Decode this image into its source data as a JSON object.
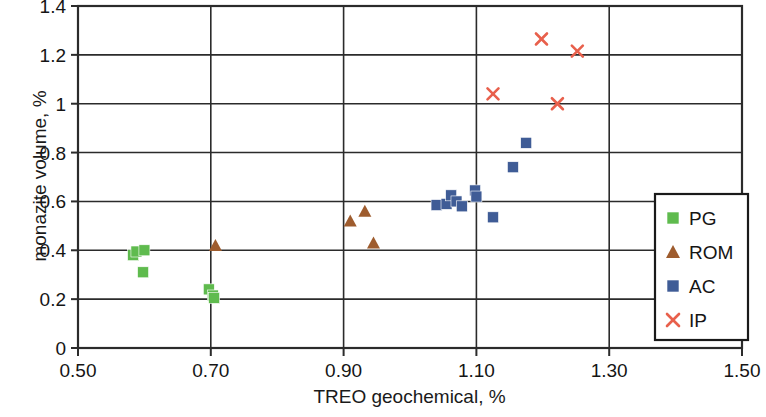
{
  "chart_data": {
    "type": "scatter",
    "title": "",
    "xlabel": "TREO geochemical, %",
    "ylabel": "monazite volume, %",
    "xlim": [
      0.5,
      1.5
    ],
    "ylim": [
      0,
      1.4
    ],
    "xticks": [
      "0.50",
      "0.70",
      "0.90",
      "1.10",
      "1.30",
      "1.50"
    ],
    "xtick_values": [
      0.5,
      0.7,
      0.9,
      1.1,
      1.3,
      1.5
    ],
    "yticks": [
      "0",
      "0.2",
      "0.4",
      "0.6",
      "0.8",
      "1",
      "1.2",
      "1.4"
    ],
    "ytick_values": [
      0,
      0.2,
      0.4,
      0.6,
      0.8,
      1.0,
      1.2,
      1.4
    ],
    "grid": "horizontal-and-vertical",
    "legend_position": "right-inside",
    "series": [
      {
        "name": "PG",
        "marker": "square",
        "color": "#5FBB4E",
        "points": [
          [
            0.583,
            0.38
          ],
          [
            0.588,
            0.395
          ],
          [
            0.6,
            0.4
          ],
          [
            0.598,
            0.31
          ],
          [
            0.697,
            0.24
          ],
          [
            0.703,
            0.215
          ],
          [
            0.705,
            0.205
          ]
        ]
      },
      {
        "name": "ROM",
        "marker": "triangle",
        "color": "#9E5C2E",
        "points": [
          [
            0.707,
            0.42
          ],
          [
            0.91,
            0.52
          ],
          [
            0.932,
            0.56
          ],
          [
            0.945,
            0.43
          ]
        ]
      },
      {
        "name": "AC",
        "marker": "square",
        "color": "#3F5C96",
        "points": [
          [
            1.04,
            0.585
          ],
          [
            1.055,
            0.59
          ],
          [
            1.062,
            0.625
          ],
          [
            1.07,
            0.6
          ],
          [
            1.078,
            0.58
          ],
          [
            1.098,
            0.645
          ],
          [
            1.1,
            0.62
          ],
          [
            1.125,
            0.535
          ],
          [
            1.155,
            0.74
          ],
          [
            1.175,
            0.84
          ]
        ]
      },
      {
        "name": "IP",
        "marker": "x",
        "color": "#E8604C",
        "points": [
          [
            1.125,
            1.04
          ],
          [
            1.198,
            1.265
          ],
          [
            1.222,
            1.0
          ],
          [
            1.252,
            1.215
          ]
        ]
      }
    ]
  },
  "axes": {
    "x_title": "TREO geochemical, %",
    "y_title": "monazite volume, %"
  },
  "legend": {
    "entries": [
      {
        "label": "PG"
      },
      {
        "label": "ROM"
      },
      {
        "label": "AC"
      },
      {
        "label": "IP"
      }
    ]
  }
}
